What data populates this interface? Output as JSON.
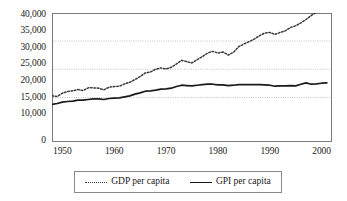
{
  "chart_data": {
    "type": "line",
    "title": "",
    "xlabel": "",
    "ylabel": "",
    "xlim": [
      1948,
      2002
    ],
    "ylim": [
      0,
      40000
    ],
    "grid": "horizontal-dotted",
    "legend_position": "bottom",
    "y_ticks": [
      {
        "value": 40000,
        "label": "40,000"
      },
      {
        "value": 35000,
        "label": "35,000"
      },
      {
        "value": 30000,
        "label": "30,000"
      },
      {
        "value": 25000,
        "label": "25,000"
      },
      {
        "value": 20000,
        "label": "20,000"
      },
      {
        "value": 15000,
        "label": "15,000"
      },
      {
        "value": 10000,
        "label": "10,000"
      },
      {
        "value": 0,
        "label": "0"
      }
    ],
    "x_ticks": [
      {
        "value": 1950,
        "label": "1950"
      },
      {
        "value": 1960,
        "label": "1960"
      },
      {
        "value": 1970,
        "label": "1970"
      },
      {
        "value": 1980,
        "label": "1980"
      },
      {
        "value": 1990,
        "label": "1990"
      },
      {
        "value": 2000,
        "label": "2000"
      }
    ],
    "gridlines": [
      32000,
      23500,
      15000
    ],
    "x": [
      1948,
      1949,
      1950,
      1951,
      1952,
      1953,
      1954,
      1955,
      1956,
      1957,
      1958,
      1959,
      1960,
      1961,
      1962,
      1963,
      1964,
      1965,
      1966,
      1967,
      1968,
      1969,
      1970,
      1971,
      1972,
      1973,
      1974,
      1975,
      1976,
      1977,
      1978,
      1979,
      1980,
      1981,
      1982,
      1983,
      1984,
      1985,
      1986,
      1987,
      1988,
      1989,
      1990,
      1991,
      1992,
      1993,
      1994,
      1995,
      1996,
      1997,
      1998,
      1999,
      2000,
      2001
    ],
    "series": [
      {
        "name": "GDP per capita",
        "style": "dotted",
        "color": "#3a3a3a",
        "values": [
          15500,
          15300,
          16300,
          16800,
          17000,
          17400,
          17100,
          17900,
          17900,
          17800,
          17300,
          18100,
          18300,
          18400,
          19100,
          19600,
          20400,
          21300,
          22400,
          22700,
          23500,
          23900,
          23600,
          24100,
          25100,
          26200,
          25800,
          25400,
          26400,
          27300,
          28400,
          28900,
          28400,
          28700,
          27800,
          28600,
          30300,
          31100,
          31800,
          32600,
          33600,
          34400,
          34600,
          34000,
          34600,
          35100,
          36100,
          36600,
          37500,
          38500,
          39700,
          40700,
          41800,
          41500
        ]
      },
      {
        "name": "GPI per capita",
        "style": "solid",
        "color": "#1a1a1a",
        "values": [
          12900,
          13200,
          13600,
          13800,
          13900,
          14200,
          14200,
          14400,
          14600,
          14600,
          14400,
          14700,
          14800,
          14900,
          15200,
          15500,
          16000,
          16400,
          16900,
          17000,
          17200,
          17500,
          17600,
          17800,
          18300,
          18700,
          18600,
          18500,
          18700,
          18900,
          19000,
          19000,
          18800,
          18800,
          18600,
          18700,
          18900,
          18900,
          18900,
          18900,
          18900,
          18800,
          18700,
          18400,
          18500,
          18500,
          18600,
          18500,
          19000,
          19400,
          19000,
          19100,
          19300,
          19400
        ]
      }
    ]
  },
  "legend": {
    "items": [
      {
        "label": "GDP per capita",
        "style": "dotted"
      },
      {
        "label": "GPI per capita",
        "style": "solid"
      }
    ]
  }
}
